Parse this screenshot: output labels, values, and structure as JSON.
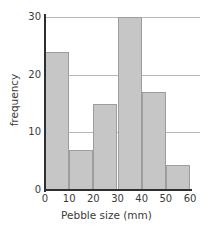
{
  "chart_data": {
    "type": "bar",
    "title": "",
    "subtitle": "",
    "xlabel": "Pebble size (mm)",
    "ylabel": "frequency",
    "categories": [
      "0-10",
      "10-20",
      "20-30",
      "30-40",
      "40-50",
      "50-60"
    ],
    "bin_edges": [
      0,
      10,
      20,
      30,
      40,
      50,
      60
    ],
    "bin_width": 10,
    "values": [
      24,
      7,
      15,
      30,
      17,
      4.3
    ],
    "xlim": [
      0,
      60
    ],
    "ylim": [
      0,
      30
    ],
    "xticks": [
      "0",
      "10",
      "20",
      "30",
      "40",
      "50",
      "60"
    ],
    "xtick_values": [
      0,
      10,
      20,
      30,
      40,
      50,
      60
    ],
    "yticks": [
      "0",
      "10",
      "20",
      "30"
    ],
    "ytick_values": [
      0,
      10,
      20,
      30
    ],
    "grid": true,
    "gridlines_at": [
      10,
      20,
      30
    ],
    "legend": false,
    "legend_position": "none",
    "bar_fill_color": "#c6c6c6",
    "bar_border_color": "#9d9d9d",
    "axis_color": "#2f2f2f",
    "grid_color": "#b9b9b9",
    "text_color": "#3b3b3b",
    "background_color": "#ffffff"
  }
}
